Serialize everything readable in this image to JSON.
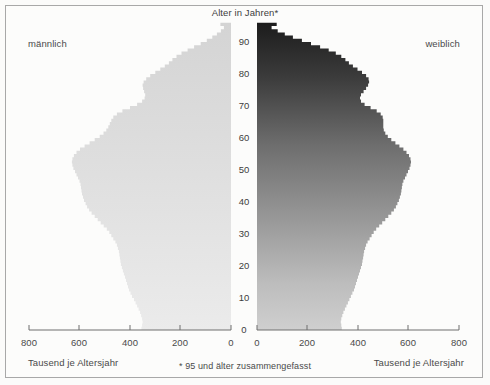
{
  "chart_data": {
    "type": "bar",
    "orientation": "population-pyramid",
    "title": "Alter in Jahren*",
    "footnote": "* 95 und älter zusammengefasst",
    "left_label": "männlich",
    "right_label": "weiblich",
    "xlabel_left": "Tausend je Altersjahr",
    "xlabel_right": "Tausend je Altersjahr",
    "ylabel": "Alter in Jahren",
    "xlim": [
      0,
      800
    ],
    "ylim": [
      0,
      95
    ],
    "grid": false,
    "legend": "none",
    "x_ticks_left": [
      "800",
      "600",
      "400",
      "200",
      "0"
    ],
    "x_ticks_right": [
      "0",
      "200",
      "400",
      "600",
      "800"
    ],
    "x_tick_values": [
      800,
      600,
      400,
      200,
      0
    ],
    "y_ticks": [
      "0",
      "10",
      "20",
      "30",
      "40",
      "50",
      "60",
      "70",
      "80",
      "90"
    ],
    "y_tick_values": [
      0,
      10,
      20,
      30,
      40,
      50,
      60,
      70,
      80,
      90
    ],
    "unit": "Tausend je Altersjahr",
    "ages": [
      0,
      1,
      2,
      3,
      4,
      5,
      6,
      7,
      8,
      9,
      10,
      11,
      12,
      13,
      14,
      15,
      16,
      17,
      18,
      19,
      20,
      21,
      22,
      23,
      24,
      25,
      26,
      27,
      28,
      29,
      30,
      31,
      32,
      33,
      34,
      35,
      36,
      37,
      38,
      39,
      40,
      41,
      42,
      43,
      44,
      45,
      46,
      47,
      48,
      49,
      50,
      51,
      52,
      53,
      54,
      55,
      56,
      57,
      58,
      59,
      60,
      61,
      62,
      63,
      64,
      65,
      66,
      67,
      68,
      69,
      70,
      71,
      72,
      73,
      74,
      75,
      76,
      77,
      78,
      79,
      80,
      81,
      82,
      83,
      84,
      85,
      86,
      87,
      88,
      89,
      90,
      91,
      92,
      93,
      94,
      95
    ],
    "series": [
      {
        "name": "männlich",
        "side": "left",
        "color": "#d2d2d2",
        "values": [
          355,
          352,
          350,
          352,
          356,
          360,
          366,
          372,
          378,
          384,
          392,
          398,
          404,
          408,
          412,
          416,
          420,
          424,
          428,
          432,
          436,
          438,
          440,
          442,
          444,
          448,
          452,
          458,
          466,
          474,
          482,
          492,
          504,
          516,
          528,
          540,
          552,
          562,
          570,
          576,
          582,
          586,
          590,
          592,
          594,
          596,
          600,
          606,
          612,
          618,
          624,
          628,
          630,
          628,
          622,
          612,
          598,
          580,
          560,
          540,
          520,
          505,
          494,
          486,
          480,
          474,
          466,
          452,
          430,
          400,
          372,
          352,
          342,
          340,
          344,
          348,
          350,
          346,
          336,
          320,
          300,
          280,
          262,
          246,
          232,
          216,
          196,
          172,
          146,
          120,
          96,
          74,
          56,
          40,
          28,
          42
        ]
      },
      {
        "name": "weiblich",
        "side": "right",
        "color": "#4a4a4a",
        "values": [
          336,
          334,
          332,
          334,
          338,
          342,
          348,
          354,
          360,
          366,
          372,
          378,
          384,
          388,
          392,
          396,
          400,
          404,
          408,
          412,
          416,
          418,
          420,
          422,
          424,
          428,
          432,
          438,
          446,
          454,
          462,
          472,
          484,
          496,
          508,
          520,
          532,
          542,
          550,
          556,
          562,
          566,
          570,
          572,
          574,
          576,
          580,
          586,
          592,
          598,
          604,
          608,
          610,
          608,
          602,
          592,
          580,
          564,
          548,
          532,
          518,
          508,
          502,
          500,
          500,
          500,
          498,
          490,
          474,
          450,
          426,
          412,
          408,
          412,
          422,
          432,
          440,
          444,
          442,
          432,
          416,
          398,
          380,
          364,
          350,
          334,
          312,
          284,
          250,
          214,
          178,
          142,
          110,
          82,
          58,
          78
        ]
      }
    ]
  },
  "axis": {
    "left_ticks": [
      {
        "label": "800",
        "x": 29
      },
      {
        "label": "600",
        "x": 79
      },
      {
        "label": "400",
        "x": 130
      },
      {
        "label": "200",
        "x": 180
      },
      {
        "label": "0",
        "x": 231
      }
    ],
    "right_ticks": [
      {
        "label": "0",
        "x": 257
      },
      {
        "label": "200",
        "x": 307
      },
      {
        "label": "400",
        "x": 358
      },
      {
        "label": "600",
        "x": 408
      },
      {
        "label": "800",
        "x": 459
      }
    ],
    "age_ticks": [
      {
        "label": "0",
        "y": 325
      },
      {
        "label": "10",
        "y": 295
      },
      {
        "label": "20",
        "y": 263
      },
      {
        "label": "30",
        "y": 232
      },
      {
        "label": "40",
        "y": 200
      },
      {
        "label": "50",
        "y": 169
      },
      {
        "label": "60",
        "y": 138
      },
      {
        "label": "70",
        "y": 107
      },
      {
        "label": "80",
        "y": 76
      },
      {
        "label": "90",
        "y": 45
      }
    ]
  },
  "colors": {
    "male_fill_top": "#d8d8d8",
    "male_fill_bottom": "#e9e9e9",
    "female_fill_top": "#222222",
    "female_fill_bottom": "#c9c9c9",
    "frame": "#a8a8a8",
    "axis_line": "#6e6e6e",
    "text": "#4a4a4a",
    "background": "#fcfcfb"
  }
}
